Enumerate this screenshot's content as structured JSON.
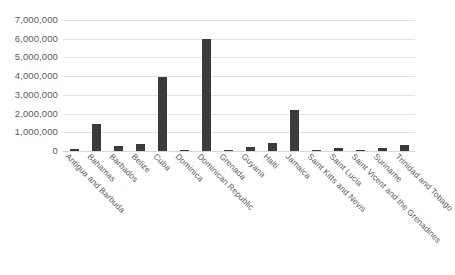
{
  "chart_data": {
    "type": "bar",
    "title": "",
    "xlabel": "",
    "ylabel": "",
    "ylim": [
      0,
      7000000
    ],
    "ytick_step": 1000000,
    "grid": true,
    "legend": "none",
    "bar_color": "#3b3b3b",
    "gridline_color": "#e3e3e3",
    "categories": [
      "Antigua and Barbuda",
      "Bahamas",
      "Barbados",
      "Belize",
      "Cuba",
      "Dominica",
      "Dominican Republic",
      "Grenada",
      "Guyana",
      "Haiti",
      "Jamaica",
      "Saint Kitts and Nevis",
      "Saint Lucia",
      "Saint Vicent and the Grenadines",
      "Suriname",
      "Trinidad and Tobago"
    ],
    "values": [
      100000,
      1450000,
      290000,
      400000,
      3960000,
      30000,
      5990000,
      60000,
      200000,
      450000,
      2200000,
      50000,
      170000,
      40000,
      150000,
      330000
    ],
    "ytick_labels": [
      "7,000,000",
      "6,000,000",
      "5,000,000",
      "4,000,000",
      "3,000,000",
      "2,000,000",
      "1,000,000",
      "0"
    ],
    "ytick_values": [
      7000000,
      6000000,
      5000000,
      4000000,
      3000000,
      2000000,
      1000000,
      0
    ]
  }
}
